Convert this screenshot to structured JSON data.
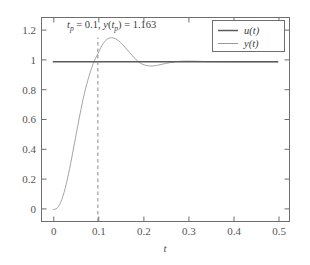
{
  "chart_data": {
    "type": "line",
    "title": "",
    "xlabel": "t",
    "ylabel": "",
    "xlim": [
      -0.025,
      0.525
    ],
    "ylim": [
      -0.08,
      1.3
    ],
    "grid": false,
    "legend_position": "top-right",
    "xticks": [
      "0",
      "0.1",
      "0.2",
      "0.3",
      "0.4",
      "0.5"
    ],
    "xtick_values": [
      0,
      0.1,
      0.2,
      0.3,
      0.4,
      0.5
    ],
    "yticks": [
      "0",
      "0.2",
      "0.4",
      "0.6",
      "0.8",
      "1",
      "1.2"
    ],
    "ytick_values": [
      0,
      0.2,
      0.4,
      0.6,
      0.8,
      1,
      1.2
    ],
    "series": [
      {
        "name": "u(t)",
        "style": "solid",
        "color": "#5a5a5a",
        "x": [
          0,
          0.5
        ],
        "values": [
          1,
          1
        ]
      },
      {
        "name": "y(t)",
        "style": "solid",
        "color": "#9a9a9a",
        "x": [
          0,
          0.01,
          0.02,
          0.03,
          0.04,
          0.05,
          0.06,
          0.07,
          0.08,
          0.09,
          0.1,
          0.11,
          0.12,
          0.13,
          0.14,
          0.15,
          0.16,
          0.17,
          0.18,
          0.19,
          0.2,
          0.21,
          0.22,
          0.23,
          0.24,
          0.25,
          0.26,
          0.27,
          0.28,
          0.3,
          0.32,
          0.35,
          0.4,
          0.45,
          0.5
        ],
        "values": [
          0,
          0.012,
          0.068,
          0.175,
          0.318,
          0.48,
          0.64,
          0.784,
          0.9,
          0.99,
          1.055,
          1.115,
          1.152,
          1.163,
          1.155,
          1.132,
          1.1,
          1.064,
          1.03,
          1.0,
          0.982,
          0.974,
          0.972,
          0.975,
          0.982,
          0.989,
          0.995,
          1.0,
          1.003,
          1.005,
          1.004,
          1.001,
          1.0,
          1.0,
          1.0
        ]
      }
    ],
    "annotations": [
      {
        "name": "peak-annotation",
        "text_parts": {
          "t_sym": "t",
          "t_sub": "p",
          "eq1": " = 0.1, ",
          "y_sym": "y",
          "paren_open": "(",
          "t_sym2": "t",
          "t_sub2": "p",
          "paren_close": ")",
          "eq2": " = 1.163"
        },
        "full_text": "tp = 0.1, y(tp) = 1.163",
        "peak_time": 0.1,
        "peak_value": 1.163,
        "marker": "dashed-vertical-line"
      }
    ]
  },
  "legend": {
    "items": [
      {
        "label_base": "u",
        "label_arg": "(t)",
        "full": "u(t)"
      },
      {
        "label_base": "y",
        "label_arg": "(t)",
        "full": "y(t)"
      }
    ]
  },
  "colors": {
    "background": "#ffffff",
    "axis": "#6e6e6e",
    "text": "#555555",
    "series_u": "#5a5a5a",
    "series_y": "#9a9a9a",
    "dash": "#8a8a8a"
  }
}
